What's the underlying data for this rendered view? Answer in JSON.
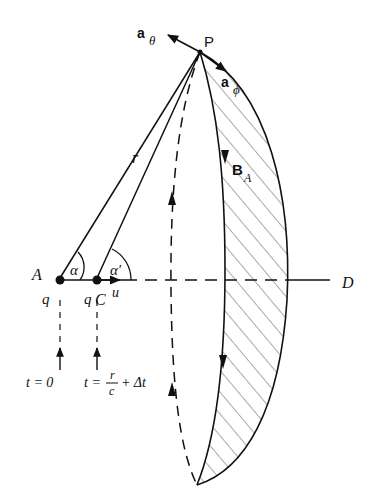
{
  "figure": {
    "labels": {
      "a_theta": "a",
      "a_theta_sub": "θ",
      "P": "P",
      "a_phi": "a",
      "a_phi_sub": "ϕ",
      "B_A": "B",
      "B_A_sub": "A",
      "r": "r",
      "A": "A",
      "alpha": "α",
      "alpha_prime": "α′",
      "q_left": "q",
      "q_right": "q",
      "C": "C",
      "u": "u",
      "D": "D",
      "t0": "t = 0",
      "t1_prefix": "t =",
      "t1_num": "r",
      "t1_den": "c",
      "t1_suffix": "+ Δt"
    },
    "colors": {
      "ink": "#111111",
      "hatch": "#555555",
      "background": "#ffffff"
    }
  }
}
